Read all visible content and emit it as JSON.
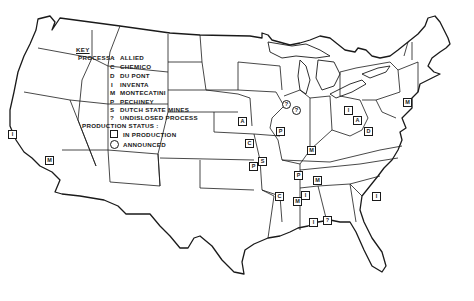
{
  "legend": {
    "title": "KEY",
    "process_label": "PROCESS :",
    "processes": [
      {
        "code": "A",
        "name": "ALLIED"
      },
      {
        "code": "C",
        "name": "CHEMICO"
      },
      {
        "code": "D",
        "name": "DU PONT"
      },
      {
        "code": "I",
        "name": "INVENTA"
      },
      {
        "code": "M",
        "name": "MONTECATINI"
      },
      {
        "code": "P",
        "name": "PECHINEY"
      },
      {
        "code": "S",
        "name": "DUTCH STATE MINES"
      },
      {
        "code": "?",
        "name": "UNDISLOSED PROCESS"
      }
    ],
    "status_label": "PRODUCTION STATUS :",
    "statuses": [
      {
        "symbol": "square",
        "name": "IN PRODUCTION"
      },
      {
        "symbol": "circle",
        "name": "ANNOUNCED"
      }
    ]
  },
  "markers": [
    {
      "code": "I",
      "status": "in-production",
      "x": 12,
      "y": 134
    },
    {
      "code": "M",
      "status": "in-production",
      "x": 49,
      "y": 160
    },
    {
      "code": "A",
      "status": "in-production",
      "x": 242,
      "y": 121
    },
    {
      "code": "C",
      "status": "in-production",
      "x": 249,
      "y": 143
    },
    {
      "code": "P",
      "status": "in-production",
      "x": 253,
      "y": 166
    },
    {
      "code": "S",
      "status": "in-production",
      "x": 262,
      "y": 161
    },
    {
      "code": "?",
      "status": "announced",
      "x": 286,
      "y": 104
    },
    {
      "code": "?",
      "status": "announced",
      "x": 296,
      "y": 110
    },
    {
      "code": "P",
      "status": "in-production",
      "x": 280,
      "y": 131
    },
    {
      "code": "M",
      "status": "in-production",
      "x": 311,
      "y": 150
    },
    {
      "code": "I",
      "status": "in-production",
      "x": 348,
      "y": 110
    },
    {
      "code": "A",
      "status": "in-production",
      "x": 357,
      "y": 120
    },
    {
      "code": "D",
      "status": "in-production",
      "x": 368,
      "y": 131
    },
    {
      "code": "M",
      "status": "in-production",
      "x": 407,
      "y": 102
    },
    {
      "code": "P",
      "status": "in-production",
      "x": 298,
      "y": 175
    },
    {
      "code": "M",
      "status": "in-production",
      "x": 317,
      "y": 180
    },
    {
      "code": "C",
      "status": "in-production",
      "x": 279,
      "y": 196
    },
    {
      "code": "I",
      "status": "in-production",
      "x": 305,
      "y": 195
    },
    {
      "code": "M",
      "status": "in-production",
      "x": 297,
      "y": 201
    },
    {
      "code": "I",
      "status": "in-production",
      "x": 313,
      "y": 222
    },
    {
      "code": "?",
      "status": "in-production",
      "x": 327,
      "y": 220
    },
    {
      "code": "I",
      "status": "in-production",
      "x": 376,
      "y": 196
    }
  ],
  "colors": {
    "ink": "#1a1a1a",
    "paper": "#ffffff"
  }
}
